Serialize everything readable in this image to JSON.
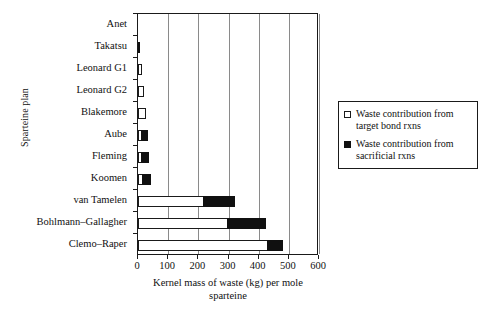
{
  "chart_data": {
    "type": "bar",
    "orientation": "horizontal",
    "stacked": true,
    "title": "",
    "xlabel": "Kernel mass of waste (kg) per mole sparteine",
    "ylabel": "Sparteine plan",
    "xlim": [
      0,
      600
    ],
    "xticks": [
      0,
      100,
      200,
      300,
      400,
      500,
      600
    ],
    "xtick_labels": [
      "0",
      "100",
      "200",
      "300",
      "400",
      "500",
      "600"
    ],
    "grid": "vertical",
    "legend_position": "right-outside",
    "categories": [
      "Anet",
      "Takatsu",
      "Leonard G1",
      "Leonard G2",
      "Blakemore",
      "Aube",
      "Fleming",
      "Koomen",
      "van Tamelen",
      "Bohlmann–Gallagher",
      "Clemo–Raper"
    ],
    "series": [
      {
        "name": "Waste contribution from target bond rxns",
        "color": "#ffffff",
        "edge_color": "#1a1a1a",
        "values": [
          0,
          0,
          12,
          20,
          28,
          10,
          10,
          12,
          215,
          295,
          428
        ]
      },
      {
        "name": "Waste contribution from sacrificial rxns",
        "color": "#101010",
        "edge_color": "#101010",
        "values": [
          0,
          5,
          0,
          0,
          0,
          22,
          28,
          30,
          108,
          128,
          52
        ]
      }
    ],
    "totals": [
      0,
      5,
      12,
      20,
      28,
      32,
      38,
      42,
      323,
      423,
      480
    ]
  },
  "legend": {
    "entries": [
      {
        "swatch": "open-square",
        "label": "Waste contribution from target bond rxns"
      },
      {
        "swatch": "filled-square",
        "label": "Waste contribution from sacrificial rxns"
      }
    ]
  },
  "axes": {
    "x_title_line1": "Kernel mass of waste (kg) per mole",
    "x_title_line2": "sparteine",
    "y_title": "Sparteine plan"
  }
}
